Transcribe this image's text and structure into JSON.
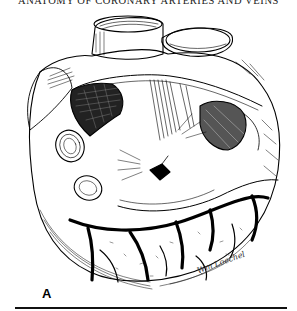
{
  "page": {
    "running_head": "ANATOMY OF CORONARY ARTERIES AND VEINS"
  },
  "figure": {
    "panel_label": "A",
    "artist_signature": "Wm Loechel",
    "style": "black-and-white pen-and-ink anatomical illustration"
  },
  "colors": {
    "ink": "#000000",
    "paper": "#ffffff"
  }
}
